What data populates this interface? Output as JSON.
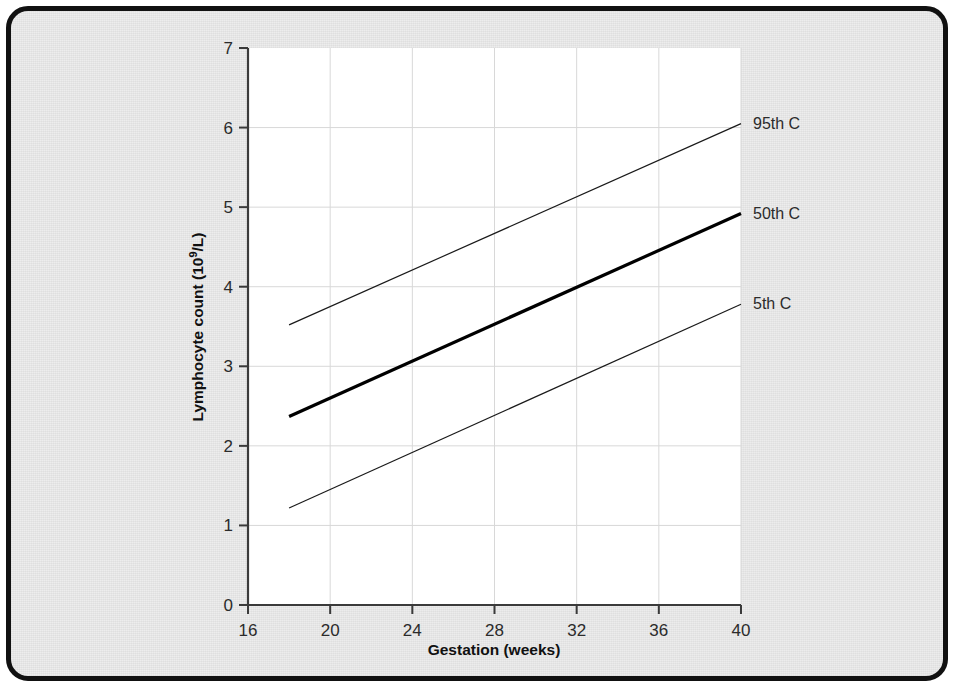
{
  "figure": {
    "background_color": "#ececec",
    "plot_background_color": "#ffffff",
    "frame_color": "#111111"
  },
  "chart_data": {
    "type": "line",
    "title": "",
    "xlabel": "Gestation (weeks)",
    "ylabel": "Lymphocyte count (10⁹/L)",
    "ylabel_parts": {
      "main": "Lymphocyte count (10",
      "sup": "9",
      "tail": "/L)"
    },
    "xlim": [
      16,
      40
    ],
    "ylim": [
      0,
      7
    ],
    "xticks": [
      16,
      20,
      24,
      28,
      32,
      36,
      40
    ],
    "xtick_labels": [
      "16",
      "20",
      "24",
      "28",
      "32",
      "36",
      "40"
    ],
    "yticks": [
      0,
      1,
      2,
      3,
      4,
      5,
      6,
      7
    ],
    "ytick_labels": [
      "0",
      "1",
      "2",
      "3",
      "4",
      "5",
      "6",
      "7"
    ],
    "grid": true,
    "grid_color": "#d8d8d8",
    "legend_position": "right-inline",
    "x": [
      18,
      40
    ],
    "series": [
      {
        "name": "95th C",
        "label": "95th C",
        "values": [
          3.52,
          6.05
        ],
        "line_width": 1.2,
        "color": "#1a1a1a",
        "label_y_value": 6.05
      },
      {
        "name": "50th C",
        "label": "50th C",
        "values": [
          2.37,
          4.92
        ],
        "line_width": 3.2,
        "color": "#000000",
        "label_y_value": 4.92
      },
      {
        "name": "5th C",
        "label": "5th C",
        "values": [
          1.22,
          3.78
        ],
        "line_width": 1.2,
        "color": "#1a1a1a",
        "label_y_value": 3.78
      }
    ]
  }
}
